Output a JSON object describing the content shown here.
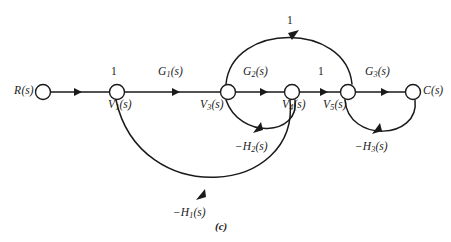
{
  "figure": {
    "caption": "(c)",
    "type": "signal-flow-graph",
    "background_color": "#ffffff",
    "line_color": "#1a1a1a"
  },
  "nodes": [
    {
      "id": "R",
      "label_text": "R",
      "label_sub": "",
      "label_suffix": "(s)",
      "x": 43,
      "y": 92
    },
    {
      "id": "V1",
      "label_text": "V",
      "label_sub": "1",
      "label_suffix": "(s)",
      "x": 117,
      "y": 92
    },
    {
      "id": "V3",
      "label_text": "V",
      "label_sub": "3",
      "label_suffix": "(s)",
      "x": 228,
      "y": 92
    },
    {
      "id": "V4",
      "label_text": "V",
      "label_sub": "4",
      "label_suffix": "(s)",
      "x": 292,
      "y": 92
    },
    {
      "id": "V5",
      "label_text": "V",
      "label_sub": "5",
      "label_suffix": "(s)",
      "x": 348,
      "y": 92
    },
    {
      "id": "C",
      "label_text": "C",
      "label_sub": "",
      "label_suffix": "(s)",
      "x": 413,
      "y": 92
    }
  ],
  "edges": [
    {
      "from": "R",
      "to": "V3",
      "gain": "1",
      "kind": "straight",
      "label_position": "above"
    },
    {
      "from": "V1",
      "to": "V3",
      "gain": "G1(s)",
      "kind": "straight",
      "label_position": "above"
    },
    {
      "from": "V3",
      "to": "V4",
      "gain": "G2(s)",
      "kind": "straight",
      "label_position": "above"
    },
    {
      "from": "V4",
      "to": "V5",
      "gain": "1",
      "kind": "straight",
      "label_position": "above"
    },
    {
      "from": "V5",
      "to": "C",
      "gain": "G3(s)",
      "kind": "straight",
      "label_position": "above"
    },
    {
      "from": "V3",
      "to": "V5",
      "gain": "1",
      "kind": "arc-above",
      "label_position": "above"
    },
    {
      "from": "V4",
      "to": "V3",
      "gain": "-H2(s)",
      "kind": "arc-below",
      "label_position": "below"
    },
    {
      "from": "C",
      "to": "V5",
      "gain": "-H3(s)",
      "kind": "arc-below",
      "label_position": "below"
    },
    {
      "from": "V4",
      "to": "V1",
      "gain": "-H1(s)",
      "kind": "arc-below-large",
      "label_position": "below"
    }
  ],
  "labels": {
    "R": {
      "base": "R",
      "sub": "",
      "suffix": "(s)"
    },
    "V1": {
      "base": "V",
      "sub": "1",
      "suffix": "(s)"
    },
    "V3": {
      "base": "V",
      "sub": "3",
      "suffix": "(s)"
    },
    "V4": {
      "base": "V",
      "sub": "4",
      "suffix": "(s)"
    },
    "V5": {
      "base": "V",
      "sub": "5",
      "suffix": "(s)"
    },
    "C": {
      "base": "C",
      "sub": "",
      "suffix": "(s)"
    },
    "G1": {
      "base": "G",
      "sub": "1",
      "suffix": "(s)"
    },
    "G2": {
      "base": "G",
      "sub": "2",
      "suffix": "(s)"
    },
    "G3": {
      "base": "G",
      "sub": "3",
      "suffix": "(s)"
    },
    "H1": {
      "base": "−H",
      "sub": "1",
      "suffix": "(s)"
    },
    "H2": {
      "base": "−H",
      "sub": "2",
      "suffix": "(s)"
    },
    "H3": {
      "base": "−H",
      "sub": "3",
      "suffix": "(s)"
    }
  },
  "gains": {
    "unity_r_to_v1": "1",
    "unity_v4_to_v5": "1",
    "unity_top_arc": "1"
  }
}
